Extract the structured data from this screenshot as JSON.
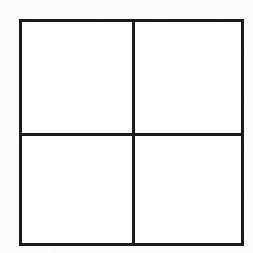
{
  "canvas": {
    "width": 253,
    "height": 253,
    "background_color": "#fcfcfc",
    "medium": "scanned line drawing"
  },
  "figure": {
    "name": "quartered square",
    "shape_type": "2x2 grid",
    "stroke_color": "#1b1b1b",
    "fill_color": "#ffffff",
    "stroke_width": 3,
    "bounds": {
      "left": 19,
      "top": 19,
      "right": 244,
      "bottom": 246,
      "width": 225,
      "height": 227
    },
    "dividers": [
      {
        "name": "vertical-divider",
        "orientation": "vertical",
        "position": 133.5,
        "stroke_width": 3
      },
      {
        "name": "horizontal-divider",
        "orientation": "horizontal",
        "position": 134.5,
        "stroke_width": 3
      }
    ],
    "quadrants": [
      {
        "name": "top-left",
        "label": "",
        "content": "",
        "x": 21,
        "y": 21,
        "width": 111,
        "height": 112
      },
      {
        "name": "top-right",
        "label": "",
        "content": "",
        "x": 135,
        "y": 21,
        "width": 107,
        "height": 112
      },
      {
        "name": "bottom-left",
        "label": "",
        "content": "",
        "x": 21,
        "y": 136,
        "width": 111,
        "height": 108
      },
      {
        "name": "bottom-right",
        "label": "",
        "content": "",
        "x": 135,
        "y": 136,
        "width": 107,
        "height": 108
      }
    ]
  }
}
